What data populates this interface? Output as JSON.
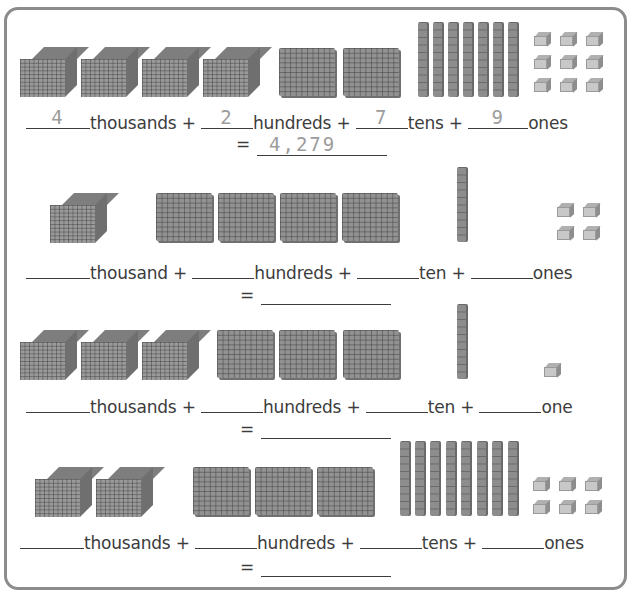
{
  "worksheet": {
    "rows": [
      {
        "blocks": {
          "thousands": 4,
          "hundreds": 2,
          "tens": 7,
          "ones": 9
        },
        "labels": {
          "thousands": "thousands +",
          "hundreds": "hundreds +",
          "tens": "tens +",
          "ones": "ones"
        },
        "answers": {
          "thousands": "4",
          "hundreds": "2",
          "tens": "7",
          "ones": "9"
        },
        "equals": "=",
        "total": "4,279"
      },
      {
        "blocks": {
          "thousands": 1,
          "hundreds": 4,
          "tens": 1,
          "ones": 4
        },
        "labels": {
          "thousands": "thousand +",
          "hundreds": "hundreds +",
          "tens": "ten +",
          "ones": "ones"
        },
        "answers": {
          "thousands": "",
          "hundreds": "",
          "tens": "",
          "ones": ""
        },
        "equals": "=",
        "total": ""
      },
      {
        "blocks": {
          "thousands": 3,
          "hundreds": 3,
          "tens": 1,
          "ones": 1
        },
        "labels": {
          "thousands": "thousands +",
          "hundreds": "hundreds +",
          "tens": "ten +",
          "ones": "one"
        },
        "answers": {
          "thousands": "",
          "hundreds": "",
          "tens": "",
          "ones": ""
        },
        "equals": "=",
        "total": ""
      },
      {
        "blocks": {
          "thousands": 2,
          "hundreds": 3,
          "tens": 8,
          "ones": 6
        },
        "labels": {
          "thousands": "thousands +",
          "hundreds": "hundreds +",
          "tens": "tens +",
          "ones": "ones"
        },
        "answers": {
          "thousands": "",
          "hundreds": "",
          "tens": "",
          "ones": ""
        },
        "equals": "=",
        "total": ""
      }
    ]
  },
  "colors": {
    "border": "#8c8c8c",
    "block": "#929292",
    "unit": "#c8c8c8",
    "text": "#3c3c3c",
    "traced": "#9c9c9c"
  }
}
